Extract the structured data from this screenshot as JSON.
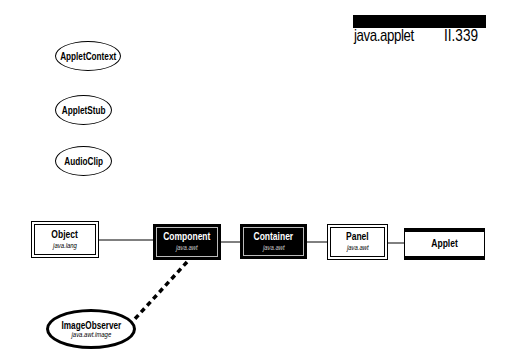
{
  "header": {
    "package": "java.applet",
    "page": "II.339"
  },
  "interfaces": [
    {
      "name": "AppletContext"
    },
    {
      "name": "AppletStub"
    },
    {
      "name": "AudioClip"
    }
  ],
  "hierarchy": [
    {
      "name": "Object",
      "package": "java.lang",
      "style": "white"
    },
    {
      "name": "Component",
      "package": "java.awt",
      "style": "black"
    },
    {
      "name": "Container",
      "package": "java.awt",
      "style": "black"
    },
    {
      "name": "Panel",
      "package": "java.awt",
      "style": "white"
    },
    {
      "name": "Applet",
      "package": "",
      "style": "applet"
    }
  ],
  "implemented_interface": {
    "name": "ImageObserver",
    "package": "java.awt.image",
    "implemented_by": "Component",
    "connector": "dashed"
  }
}
